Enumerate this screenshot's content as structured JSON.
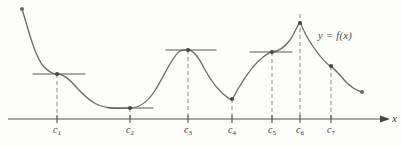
{
  "figure": {
    "kind": "calculus-critical-points-diagram",
    "curve_label": "y = f(x)",
    "axis_label": "x",
    "colors": {
      "curve": "#6e6e6e",
      "axis": "#555555",
      "tangent": "#5a5a5a",
      "dashed": "#8a8a8a",
      "point": "#4a4a4a",
      "background": "#fdfdfc",
      "text": "#3b3b3b"
    },
    "axis": {
      "y": 119,
      "x_start": 8,
      "x_end": 386,
      "arrow": true
    },
    "tick_labels": [
      {
        "name": "c1",
        "text": "c",
        "sub": "1",
        "x": 57
      },
      {
        "name": "c2",
        "text": "c",
        "sub": "2",
        "x": 130
      },
      {
        "name": "c3",
        "text": "c",
        "sub": "3",
        "x": 188
      },
      {
        "name": "c4",
        "text": "c",
        "sub": "4",
        "x": 232
      },
      {
        "name": "c5",
        "text": "c",
        "sub": "5",
        "x": 272
      },
      {
        "name": "c6",
        "text": "c",
        "sub": "6",
        "x": 300
      },
      {
        "name": "c7",
        "text": "c",
        "sub": "7",
        "x": 331
      }
    ]
  },
  "chart_data": {
    "type": "line",
    "title": "",
    "xlabel": "x",
    "ylabel": "",
    "series_label": "y = f(x)",
    "grid": false,
    "legend": "none",
    "axis_y_pixel": 119,
    "critical_points": [
      {
        "label": "c1",
        "x": 57,
        "y": 74,
        "kind": "horizontal tangent (inflection)",
        "tangent": "horizontal",
        "tangent_x1": 33,
        "tangent_x2": 85
      },
      {
        "label": "c2",
        "x": 130,
        "y": 108,
        "kind": "local minimum",
        "tangent": "horizontal",
        "tangent_x1": 108,
        "tangent_x2": 153
      },
      {
        "label": "c3",
        "x": 188,
        "y": 50,
        "kind": "local maximum",
        "tangent": "horizontal",
        "tangent_x1": 166,
        "tangent_x2": 216
      },
      {
        "label": "c4",
        "x": 232,
        "y": 99,
        "kind": "cusp / local minimum",
        "tangent": "vertical",
        "tangent_x1": null,
        "tangent_x2": null
      },
      {
        "label": "c5",
        "x": 272,
        "y": 52,
        "kind": "horizontal tangent (inflection)",
        "tangent": "horizontal",
        "tangent_x1": 250,
        "tangent_x2": 292
      },
      {
        "label": "c6",
        "x": 300,
        "y": 23,
        "kind": "cusp / absolute maximum",
        "tangent": "vertical",
        "tangent_x1": null,
        "tangent_x2": null
      },
      {
        "label": "c7",
        "x": 331,
        "y": 66,
        "kind": "marked point on decreasing branch",
        "tangent": "none",
        "tangent_x1": null,
        "tangent_x2": null
      }
    ],
    "endpoints": [
      {
        "label": "left-endpoint",
        "x": 22,
        "y": 9
      },
      {
        "label": "right-endpoint",
        "x": 362,
        "y": 92
      }
    ],
    "dashed_verticals": [
      {
        "label": "c1",
        "x": 57,
        "y_top": 74,
        "y_bottom": 119
      },
      {
        "label": "c2",
        "x": 130,
        "y_top": 108,
        "y_bottom": 119
      },
      {
        "label": "c3",
        "x": 188,
        "y_top": 50,
        "y_bottom": 119
      },
      {
        "label": "c4",
        "x": 232,
        "y_top": 99,
        "y_bottom": 119
      },
      {
        "label": "c5",
        "x": 272,
        "y_top": 52,
        "y_bottom": 119
      },
      {
        "label": "c6",
        "x": 300,
        "y_top": 14,
        "y_bottom": 119
      },
      {
        "label": "c7",
        "x": 331,
        "y_top": 66,
        "y_bottom": 119
      }
    ],
    "curve_path": "M22,9 C28,28 34,55 44,67 C50,73 53,74 57,74 C64,74 70,80 78,89 C92,104 100,107 112,108 C120,108.6 126,108 130,108 C138,108 146,104 154,92 C164,77 172,56 180,51 C184,49.5 186,50 188,50 C193,50 198,56 204,68 C212,83 222,94 229,98.6 C231,99.5 231.6,99.6 232,99.6 C232.6,99.4 234,96 238,89 C246,75 256,62 265,55.5 C268,53.4 270,52.2 272,52 C278,51.6 284,48 290,40 C294,34 297,27 299.4,22.6 C299.8,21.8 300.1,21.6 300.4,22.4 C302,27 306,36 312,45 C318,54 325,62 329,65.2 C330,66 330.6,66.2 331,66.4 C334,68.6 340,75 346,82 C352,88 358,91 362,92",
    "curve_label_position": {
      "x": 318,
      "y": 30
    }
  }
}
